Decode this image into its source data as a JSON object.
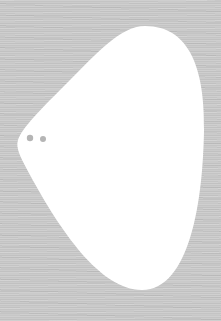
{
  "scene": {
    "description": "White rounded teardrop/pick-shaped blob on a gray wood-grain textured background with two small gray dots near the left tip",
    "background_color": "#c8c8c8",
    "shape": {
      "fill": "#ffffff",
      "path": "M 145 26 C 190 26, 205 70, 204 130 C 203 200, 190 290, 142 290 C 100 290, 60 230, 30 175 C 22 160, 15 148, 18 140 C 22 128, 40 110, 70 80 C 95 55, 120 26, 145 26 Z"
    },
    "dots": [
      {
        "cx": 30,
        "cy": 138,
        "r": 3.2,
        "fill": "#b5b5b5"
      },
      {
        "cx": 43,
        "cy": 139,
        "r": 3.0,
        "fill": "#b5b5b5"
      }
    ]
  }
}
